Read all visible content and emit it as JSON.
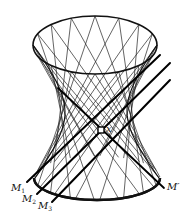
{
  "figure": {
    "type": "hyperboloid-of-one-sheet",
    "stroke_color": "#111111",
    "background": "#ffffff"
  },
  "geometry": {
    "top_ellipse": {
      "cx": 95,
      "cy": 45,
      "rx": 62,
      "ry": 29
    },
    "waist": {
      "cy": 112,
      "rx": 31
    },
    "bottom_ellipse": {
      "cx": 97,
      "cy": 178,
      "rx": 63,
      "ry": 22
    },
    "ruling_count": 16,
    "twist_deg": 110
  },
  "point": {
    "name": "x",
    "label": "x",
    "px": 101,
    "py": 130
  },
  "lines": [
    {
      "name": "M1",
      "label": "M",
      "sub": "1",
      "x1": 160,
      "y1": 55,
      "x2": 27,
      "y2": 182
    },
    {
      "name": "M2",
      "label": "M",
      "sub": "2",
      "x1": 170,
      "y1": 63,
      "x2": 37,
      "y2": 194
    },
    {
      "name": "M3",
      "label": "M",
      "sub": "3",
      "x1": 170,
      "y1": 80,
      "x2": 52,
      "y2": 202
    },
    {
      "name": "M-prime",
      "label": "M′",
      "x1": 58,
      "y1": 88,
      "x2": 164,
      "y2": 188
    }
  ],
  "labels": {
    "x": "x",
    "M1": {
      "base": "M",
      "sub": "1"
    },
    "M2": {
      "base": "M",
      "sub": "2"
    },
    "M3": {
      "base": "M",
      "sub": "3"
    },
    "Mprime": "M′"
  }
}
